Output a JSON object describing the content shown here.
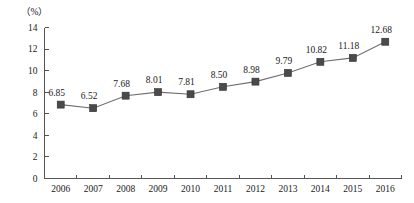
{
  "chart_data": {
    "type": "line",
    "title": "",
    "xlabel": "",
    "ylabel": "",
    "unit_label": "（%）",
    "categories": [
      "2006",
      "2007",
      "2008",
      "2009",
      "2010",
      "2011",
      "2012",
      "2013",
      "2014",
      "2015",
      "2016"
    ],
    "values": [
      6.85,
      6.52,
      7.68,
      8.01,
      7.81,
      8.5,
      8.98,
      9.79,
      10.82,
      11.18,
      12.68
    ],
    "point_labels": [
      "6.85",
      "6.52",
      "7.68",
      "8.01",
      "7.81",
      "8.50",
      "8.98",
      "9.79",
      "10.82",
      "11.18",
      "12.68"
    ],
    "ylim": [
      0,
      14
    ],
    "ytick_step": 2,
    "ytick_labels": [
      "0",
      "2",
      "4",
      "6",
      "8",
      "10",
      "12",
      "14"
    ],
    "grid": false,
    "legend": "none",
    "marker": "square",
    "colors": {
      "line": "#6e6e6e",
      "marker": "#4a4a4a",
      "axis": "#555555",
      "text": "#1a1a1a",
      "background": "#ffffff"
    }
  }
}
